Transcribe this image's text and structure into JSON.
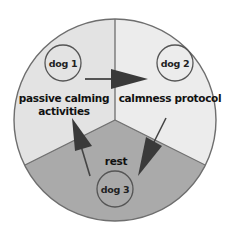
{
  "diagram": {
    "type": "cycle",
    "colors": {
      "background": "#ffffff",
      "outline": "#6e6e6e",
      "segment_light": "#e3e3e3",
      "segment_lighter": "#ececec",
      "segment_dark": "#aaaaaa",
      "arrow": "#3a3a3a"
    },
    "segments": [
      {
        "id": "top-left",
        "label_line1": "passive calming",
        "label_line2": "activities",
        "node": "dog 1"
      },
      {
        "id": "top-right",
        "label_line1": "calmness protocol",
        "node": "dog 2"
      },
      {
        "id": "bottom",
        "label_line1": "rest",
        "node": "dog 3"
      }
    ],
    "arrows": [
      {
        "from": "dog 1",
        "to": "calmness protocol"
      },
      {
        "from": "calmness protocol",
        "to": "rest"
      },
      {
        "from": "rest",
        "to": "passive calming activities"
      }
    ]
  }
}
